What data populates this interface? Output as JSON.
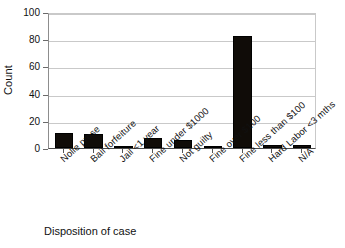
{
  "chart_data": {
    "type": "bar",
    "title": "",
    "xlabel": "Disposition of case",
    "ylabel": "Count",
    "categories": [
      "Nolle prose",
      "Bail forfeiture",
      "Jail <1 year",
      "Fine under $1000",
      "Not guilty",
      "Fine over $100",
      "Fine less than $100",
      "Hard Labor <3 mths",
      "N/A"
    ],
    "values": [
      11,
      10,
      1,
      7,
      6,
      1,
      82,
      2,
      2
    ],
    "ylim": [
      0,
      100
    ],
    "yticks": [
      0,
      20,
      40,
      60,
      80,
      100
    ],
    "ytick_labels": [
      "0",
      "20",
      "40",
      "60",
      "80",
      "100"
    ],
    "grid": true,
    "legend": false,
    "bar_color": "#100c08"
  },
  "axes": {
    "y_title": "Count",
    "x_title": "Disposition of case"
  }
}
